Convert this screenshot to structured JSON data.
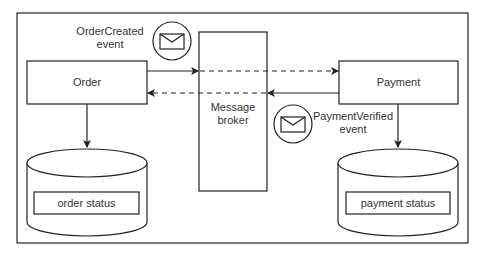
{
  "diagram": {
    "title": "",
    "nodes": {
      "order": {
        "label": "Order"
      },
      "broker": {
        "label_line1": "Message",
        "label_line2": "broker"
      },
      "payment": {
        "label": "Payment"
      },
      "order_db": {
        "label": "order status"
      },
      "payment_db": {
        "label": "payment status"
      }
    },
    "events": {
      "order_created": {
        "line1": "OrderCreated",
        "line2": "event",
        "icon": "envelope-icon"
      },
      "payment_verified": {
        "line1": "PaymentVerified",
        "line2": "event",
        "icon": "envelope-icon"
      }
    },
    "edges": [
      {
        "from": "Order",
        "to": "Message broker",
        "style": "solid"
      },
      {
        "from": "Message broker",
        "to": "Payment",
        "style": "dashed"
      },
      {
        "from": "Payment",
        "to": "Message broker",
        "style": "solid"
      },
      {
        "from": "Message broker",
        "to": "Order",
        "style": "dashed"
      },
      {
        "from": "Order",
        "to": "order status",
        "style": "solid"
      },
      {
        "from": "Payment",
        "to": "payment status",
        "style": "solid"
      }
    ],
    "colors": {
      "stroke": "#222222",
      "background": "#ffffff",
      "text": "#333333"
    }
  }
}
